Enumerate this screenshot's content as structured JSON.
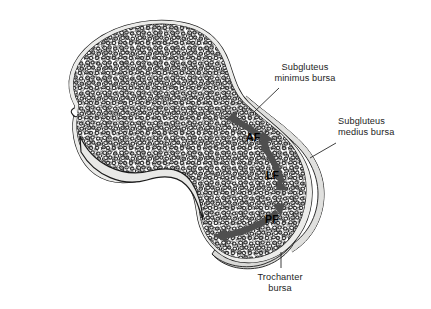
{
  "figure": {
    "background_color": "#ffffff",
    "outline_color": "#1a1a1a",
    "trabecular_color": "#2b2b2b",
    "bursa_fill_color": "#d8d8d6",
    "cortical_fill_color": "#e6e6e4",
    "arrow_color": "#4a4a4a",
    "label_color": "#1d1d1d"
  },
  "labels": {
    "subgluteus_minimus": {
      "line1": "Subgluteus",
      "line2": "minimus bursa"
    },
    "subgluteus_medius": {
      "line1": "Subgluteus",
      "line2": "medius bursa"
    },
    "trochanter": {
      "line1": "Trochanter",
      "line2": "bursa"
    }
  },
  "facets": {
    "anterior": "AF",
    "lateral": "LF",
    "posterior": "PF"
  }
}
